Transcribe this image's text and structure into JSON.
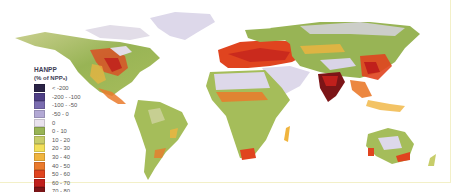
{
  "map": {
    "title": "HANPP",
    "subtitle": "(% of NPP₀)",
    "legend": [
      {
        "label": "< -200",
        "color": "#2a2346"
      },
      {
        "label": "-200 - -100",
        "color": "#4e3f86"
      },
      {
        "label": "-100 - -50",
        "color": "#7a6cb0"
      },
      {
        "label": "-50 - 0",
        "color": "#b2a8d4"
      },
      {
        "label": "0",
        "color": "#e9e2ee"
      },
      {
        "label": "0 - 10",
        "color": "#98b455"
      },
      {
        "label": "10 - 20",
        "color": "#c7cd6a"
      },
      {
        "label": "20 - 30",
        "color": "#f2e05a"
      },
      {
        "label": "30 - 40",
        "color": "#f0b43e"
      },
      {
        "label": "40 - 50",
        "color": "#ea7a2c"
      },
      {
        "label": "50 - 60",
        "color": "#e0441f"
      },
      {
        "label": "60 - 70",
        "color": "#c0201c"
      },
      {
        "label": "70 - 80",
        "color": "#7c1517"
      },
      {
        "label": "80 - 100",
        "color": "#2b1a14"
      }
    ],
    "regions": [
      "North America",
      "Greenland",
      "South America",
      "Europe",
      "Africa",
      "Asia",
      "India",
      "Australia"
    ]
  }
}
